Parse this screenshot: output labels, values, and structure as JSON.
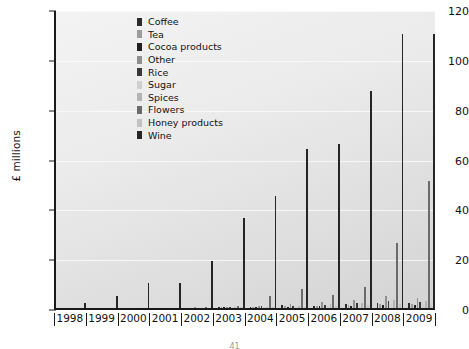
{
  "chart_data": {
    "type": "bar",
    "title": "",
    "xlabel": "",
    "ylabel": "£ millions",
    "ylim": [
      0,
      120
    ],
    "ytick_values": [
      0,
      20,
      40,
      60,
      80,
      100,
      120
    ],
    "ytick_labels": [
      "0",
      "20",
      "40",
      "60",
      "80",
      "100",
      "120"
    ],
    "grid": true,
    "legend_position": "top-center-left",
    "categories": [
      "1998",
      "1999",
      "2000",
      "2001",
      "2002",
      "2003",
      "2004",
      "2005",
      "2006",
      "2007",
      "2008",
      "2009"
    ],
    "series": [
      {
        "name": "Coffee",
        "color": "#2b2b2b",
        "values": [
          0,
          0,
          0,
          0,
          0,
          0.4,
          0.6,
          1.2,
          1.0,
          1.6,
          2.2,
          2.0
        ]
      },
      {
        "name": "Tea",
        "color": "#9c9c9c",
        "values": [
          0,
          0,
          0,
          0,
          0,
          0.3,
          0.5,
          0.8,
          1.0,
          1.4,
          1.8,
          1.6
        ]
      },
      {
        "name": "Cocoa products",
        "color": "#1f1f1f",
        "values": [
          0,
          0,
          0,
          0,
          0,
          0.3,
          0.4,
          0.6,
          0.8,
          1.0,
          1.4,
          1.2
        ]
      },
      {
        "name": "Other",
        "color": "#8f8f8f",
        "values": [
          0,
          0,
          0,
          0,
          0.4,
          0.6,
          1.0,
          1.6,
          2.4,
          3.2,
          5.0,
          4.2
        ]
      },
      {
        "name": "Rice",
        "color": "#383838",
        "values": [
          0,
          0,
          0,
          0,
          0,
          0.4,
          0.7,
          1.0,
          1.4,
          2.0,
          3.0,
          2.6
        ]
      },
      {
        "name": "Sugar",
        "color": "#cfcfcf",
        "values": [
          0,
          0,
          0,
          0,
          0,
          0.2,
          0.4,
          0.6,
          0.9,
          1.2,
          1.8,
          1.5
        ]
      },
      {
        "name": "Spices",
        "color": "#b4b4b4",
        "values": [
          0,
          0,
          0,
          0,
          0,
          0.3,
          0.6,
          1.0,
          1.5,
          2.2,
          3.4,
          2.8
        ]
      },
      {
        "name": "Flowers",
        "color": "#6b6b6b",
        "values": [
          0,
          0,
          0,
          0,
          0.5,
          1.0,
          5.0,
          7.6,
          5.2,
          8.6,
          26.0,
          51.0
        ]
      },
      {
        "name": "Honey products",
        "color": "#c2c2c2",
        "values": [
          0,
          0,
          0,
          0,
          0,
          0.2,
          0.4,
          0.6,
          0.8,
          1.1,
          1.6,
          1.4
        ]
      },
      {
        "name": "Wine",
        "color": "#252525",
        "values": [
          2,
          5,
          10,
          10,
          19,
          36,
          45,
          64,
          66,
          87,
          110,
          110
        ]
      }
    ]
  },
  "legend": {
    "items": [
      {
        "label": "Coffee"
      },
      {
        "label": "Tea"
      },
      {
        "label": "Cocoa products"
      },
      {
        "label": "Other"
      },
      {
        "label": "Rice"
      },
      {
        "label": "Sugar"
      },
      {
        "label": "Spices"
      },
      {
        "label": "Flowers"
      },
      {
        "label": "Honey products"
      },
      {
        "label": "Wine"
      }
    ]
  },
  "footer": {
    "page_number": "41"
  }
}
